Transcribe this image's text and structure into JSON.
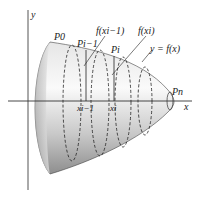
{
  "figure": {
    "type": "surface-of-revolution",
    "axes": {
      "x_label": "x",
      "y_label": "y"
    },
    "points": {
      "p0": "P0",
      "pi_minus_1": "Pi−1",
      "pi": "Pi",
      "pn": "Pn"
    },
    "x_ticks": {
      "xi_minus_1": "xi−1",
      "xi": "xi"
    },
    "annotations": {
      "f_xi_minus_1": "f(xi−1)",
      "f_xi": "f(xi)",
      "curve": "y = f(x)"
    },
    "colors": {
      "surface_light": "#f4f4f4",
      "surface_dark": "#9a9a9a",
      "line": "#222222",
      "axis": "#555555"
    }
  }
}
